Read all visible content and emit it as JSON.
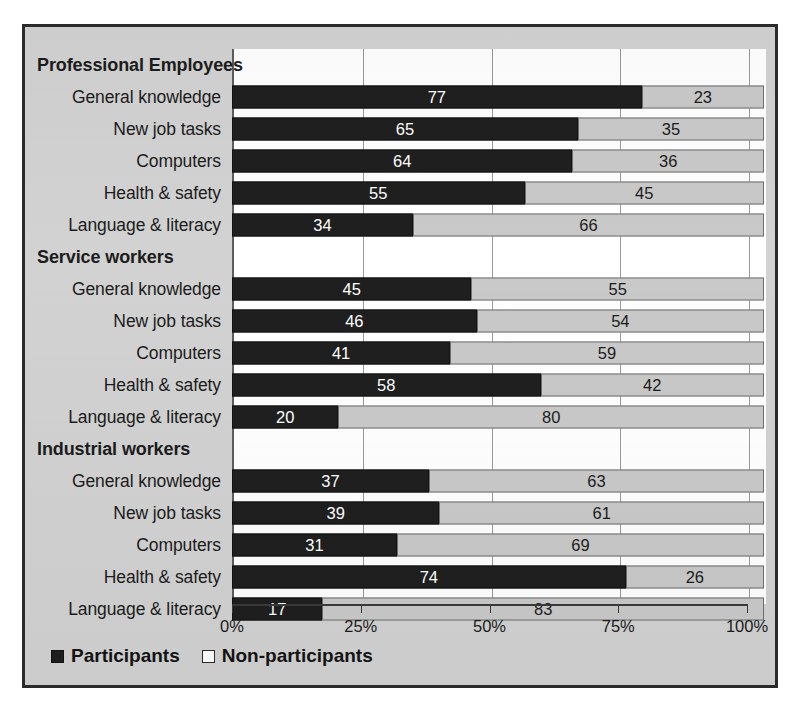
{
  "chart_data": {
    "type": "bar",
    "subtype": "stacked-horizontal-100pct",
    "title": "",
    "xlabel": "",
    "ylabel": "",
    "xlim": [
      0,
      100
    ],
    "xticks": [
      "0%",
      "25%",
      "50%",
      "75%",
      "100%"
    ],
    "xtick_values": [
      0,
      25,
      50,
      75,
      100
    ],
    "grid": true,
    "legend_position": "bottom-left",
    "series": [
      {
        "name": "Participants",
        "color": "#1f1f1f"
      },
      {
        "name": "Non-participants",
        "color": "#c9c9c9"
      }
    ],
    "groups": [
      {
        "name": "Professional Employees",
        "categories": [
          "General knowledge",
          "New job tasks",
          "Computers",
          "Health & safety",
          "Language & literacy"
        ],
        "participants": [
          77,
          65,
          64,
          55,
          34
        ],
        "non_participants": [
          23,
          35,
          36,
          45,
          66
        ]
      },
      {
        "name": "Service workers",
        "categories": [
          "General knowledge",
          "New job tasks",
          "Computers",
          "Health & safety",
          "Language & literacy"
        ],
        "participants": [
          45,
          46,
          41,
          58,
          20
        ],
        "non_participants": [
          55,
          54,
          59,
          42,
          80
        ]
      },
      {
        "name": "Industrial workers",
        "categories": [
          "General knowledge",
          "New job tasks",
          "Computers",
          "Health & safety",
          "Language & literacy"
        ],
        "participants": [
          37,
          39,
          31,
          74,
          17
        ],
        "non_participants": [
          63,
          61,
          69,
          26,
          83
        ]
      }
    ]
  },
  "legend": {
    "participants_label": "Participants",
    "non_participants_label": "Non-participants"
  },
  "colors": {
    "participants": "#1f1f1f",
    "non_participants": "#c9c9c9",
    "panel_background": "#d2d2d2",
    "plot_background": "#ffffff",
    "frame_border": "#2b2b2b"
  }
}
